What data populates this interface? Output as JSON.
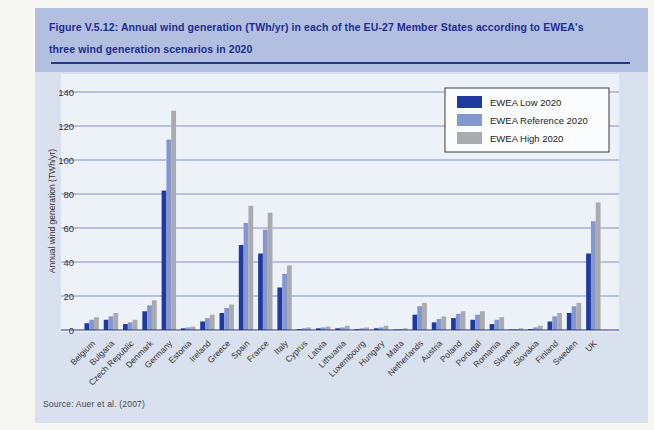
{
  "figure": {
    "title": "Figure V.5.12: Annual wind generation (TWh/yr) in each of the EU-27 Member States according to EWEA's three wind generation scenarios in 2020",
    "source": "Source: Auer et al. (2007)"
  },
  "colors": {
    "low": "#1e3a9e",
    "reference": "#8497d1",
    "high": "#a9abae",
    "titlebar_bg": "#b2bfe0",
    "panel_bg": "#d9e1ef",
    "plot_bg": "#edf1f8",
    "grid": "#7388c0",
    "axis": "#27368f",
    "title_text": "#1b2d8f",
    "tick_text": "#333333"
  },
  "chart_data": {
    "type": "bar",
    "title": "",
    "xlabel": "",
    "ylabel": "Annual wind generation (TWh/yr)",
    "ylim": [
      0,
      140
    ],
    "yticks": [
      0,
      20,
      40,
      60,
      80,
      100,
      120,
      140
    ],
    "grid": true,
    "legend_position": "top-right",
    "categories": [
      "Belgium",
      "Bulgaria",
      "Czech Republic",
      "Denmark",
      "Germany",
      "Estonia",
      "Ireland",
      "Greece",
      "Spain",
      "France",
      "Italy",
      "Cyprus",
      "Latvia",
      "Lithuania",
      "Luxembourg",
      "Hungary",
      "Malta",
      "Netherlands",
      "Austria",
      "Poland",
      "Portugal",
      "Romania",
      "Slovenia",
      "Slovakia",
      "Finland",
      "Sweden",
      "UK"
    ],
    "series": [
      {
        "name": "EWEA Low 2020",
        "color_key": "low",
        "values": [
          4,
          6,
          3.5,
          11,
          82,
          1,
          5,
          10,
          50,
          45,
          25,
          0.5,
          1,
          1,
          0.5,
          1,
          0.3,
          9,
          4.5,
          7,
          6,
          3.5,
          0.3,
          0.6,
          5,
          10,
          45
        ]
      },
      {
        "name": "EWEA Reference 2020",
        "color_key": "reference",
        "values": [
          6,
          8,
          4.5,
          14.5,
          112,
          1.5,
          7,
          13,
          63,
          59,
          33,
          1,
          1.5,
          1.5,
          1,
          1.5,
          0.6,
          14,
          6.5,
          9.5,
          9,
          6,
          0.6,
          1.5,
          8,
          14,
          64
        ]
      },
      {
        "name": "EWEA High 2020",
        "color_key": "high",
        "values": [
          7.5,
          10,
          6,
          17.5,
          129,
          2,
          9,
          15,
          73,
          69,
          38,
          1.5,
          2,
          2.5,
          1.5,
          2.5,
          1,
          16,
          8,
          11,
          11,
          7.5,
          1,
          2.5,
          10,
          16,
          75
        ]
      }
    ]
  }
}
